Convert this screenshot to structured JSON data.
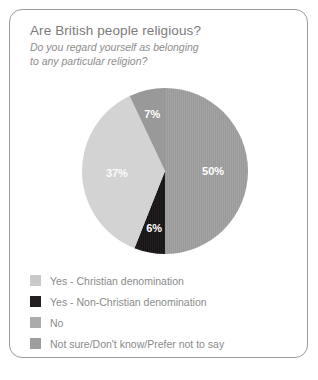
{
  "card": {
    "title": "Are British people religious?",
    "subtitle_line1": "Do you regard yourself as belonging",
    "subtitle_line2": "to any particular religion?"
  },
  "chart_data": {
    "type": "pie",
    "title": "Are British people religious?",
    "subtitle": "Do you regard yourself as belonging to any particular religion?",
    "xlabel": "",
    "ylabel": "",
    "unit": "%",
    "legend_position": "bottom-left",
    "grid": false,
    "categories": [
      "Yes - Christian denomination",
      "Yes - Non-Christian denomination",
      "No",
      "Not sure/Don't know/Prefer not to say"
    ],
    "values": [
      50,
      6,
      37,
      7
    ],
    "labels": [
      "50%",
      "6%",
      "37%",
      "7%"
    ],
    "colors": [
      "#a3a3a3",
      "#231f20",
      "#d3d3d3",
      "#999999"
    ],
    "slices": [
      {
        "name": "Yes - Christian denomination",
        "value": 50,
        "label": "50%",
        "color": "#a3a3a3",
        "pattern": "vertical-stripes",
        "label_color": "#ffffff"
      },
      {
        "name": "Yes - Non-Christian denomination",
        "value": 6,
        "label": "6%",
        "color": "#231f20",
        "pattern": "vertical-stripes",
        "label_color": "#ffffff"
      },
      {
        "name": "No",
        "value": 37,
        "label": "37%",
        "color": "#d3d3d3",
        "pattern": "solid",
        "label_color": "#fbfbfb"
      },
      {
        "name": "Not sure/Don't know/Prefer not to say",
        "value": 7,
        "label": "7%",
        "color": "#999999",
        "pattern": "solid",
        "label_color": "#ffffff"
      }
    ]
  },
  "legend": {
    "items": [
      {
        "label": "Yes - Christian denomination",
        "color": "#c9c9c9"
      },
      {
        "label": "Yes - Non-Christian denomination",
        "color": "#231f20"
      },
      {
        "label": "No",
        "color": "#ababab"
      },
      {
        "label": "Not sure/Don't know/Prefer not to say",
        "color": "#9e9e9e"
      }
    ]
  }
}
